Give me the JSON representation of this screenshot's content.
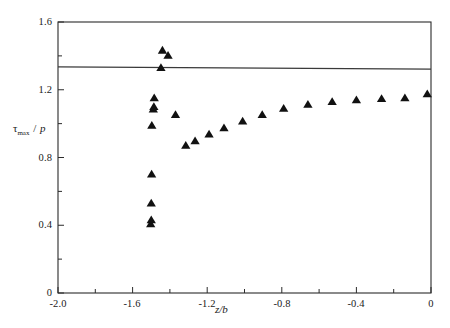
{
  "chart_data": {
    "type": "scatter",
    "title": "",
    "subtitle": "",
    "xlabel": "z/b",
    "ylabel": "τmax / p",
    "ylabel_parts": {
      "symbol": "τ",
      "subscript": "max",
      "separator": "/",
      "denominator": "p"
    },
    "xlim": [
      -2.0,
      0.0
    ],
    "ylim": [
      0.0,
      1.6
    ],
    "xticks": [
      -2.0,
      -1.8,
      -1.6,
      -1.4,
      -1.2,
      -1.0,
      -0.8,
      -0.6,
      -0.4,
      -0.2,
      0.0
    ],
    "yticks": [
      0.0,
      0.2,
      0.4,
      0.6,
      0.8,
      1.0,
      1.2,
      1.4,
      1.6
    ],
    "xtick_labels": [
      "-2.0",
      "",
      "-1.6",
      "",
      "-1.2",
      "",
      "-0.8",
      "",
      "-0.4",
      "",
      "0"
    ],
    "ytick_labels": [
      "0",
      "",
      "0.4",
      "",
      "0.8",
      "",
      "1.2",
      "",
      "1.6"
    ],
    "xtick_labels_major": [
      "-2.0",
      "-1.6",
      "-1.2",
      "-0.8",
      "-0.4",
      "0"
    ],
    "ytick_labels_major": [
      "0",
      "0.4",
      "0.8",
      "1.2",
      "1.6"
    ],
    "xtick_values_major": [
      -2.0,
      -1.6,
      -1.2,
      -0.8,
      -0.4,
      0.0
    ],
    "ytick_values_major": [
      0.0,
      0.4,
      0.8,
      1.2,
      1.6
    ],
    "grid": false,
    "legend": null,
    "marker": "triangle-up",
    "marker_color": "#111111",
    "marker_size": 5.4,
    "reference_line": {
      "type": "horizontal",
      "value": 1.33,
      "y_left": 1.335,
      "y_right": 1.322,
      "color": "#3a3a3a",
      "width": 1.2
    },
    "series": [
      {
        "name": "tau_max/p",
        "points": [
          [
            -1.503,
            0.408
          ],
          [
            -1.5,
            0.432
          ],
          [
            -1.5,
            0.53
          ],
          [
            -1.498,
            0.702
          ],
          [
            -1.497,
            0.99
          ],
          [
            -1.489,
            1.085
          ],
          [
            -1.486,
            1.1
          ],
          [
            -1.484,
            1.152
          ],
          [
            -1.448,
            1.33
          ],
          [
            -1.44,
            1.433
          ],
          [
            -1.41,
            1.403
          ],
          [
            -1.37,
            1.053
          ],
          [
            -1.315,
            0.872
          ],
          [
            -1.265,
            0.898
          ],
          [
            -1.19,
            0.938
          ],
          [
            -1.11,
            0.975
          ],
          [
            -1.01,
            1.015
          ],
          [
            -0.905,
            1.053
          ],
          [
            -0.79,
            1.09
          ],
          [
            -0.66,
            1.113
          ],
          [
            -0.53,
            1.13
          ],
          [
            -0.4,
            1.14
          ],
          [
            -0.265,
            1.148
          ],
          [
            -0.14,
            1.152
          ],
          [
            -0.02,
            1.175
          ]
        ]
      }
    ]
  },
  "axes": {
    "y_label_text": "τmax / p",
    "x_label_text": "z/b"
  }
}
